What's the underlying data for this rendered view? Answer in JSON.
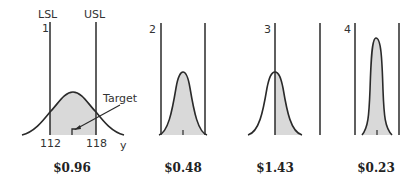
{
  "diagram": {
    "panels": [
      {
        "number": "1",
        "lsl_label": "LSL",
        "usl_label": "USL",
        "lsl_value": "112",
        "usl_value": "118",
        "axis_label": "y",
        "annotation": "Target",
        "cost": "$0.96",
        "description": "Wide distribution centered on target, tails exceed both spec limits"
      },
      {
        "number": "2",
        "cost": "$0.48",
        "description": "Narrower distribution centered on target, within spec limits"
      },
      {
        "number": "3",
        "cost": "$1.43",
        "description": "Narrow distribution centered on LSL, half out of spec"
      },
      {
        "number": "4",
        "cost": "$0.23",
        "description": "Very narrow distribution centered on target, well within spec"
      }
    ],
    "colors": {
      "line": "#2a2a2a",
      "fill": "#d9d9d9"
    }
  }
}
